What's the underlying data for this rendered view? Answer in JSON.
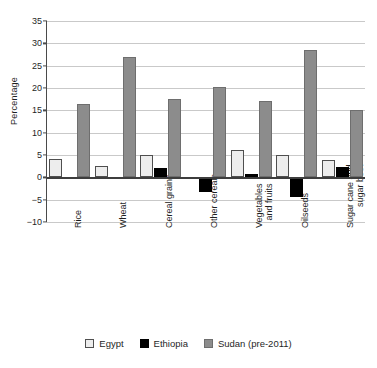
{
  "chart_data": {
    "type": "bar",
    "title": "",
    "xlabel": "",
    "ylabel": "Percentage",
    "ylim": [
      -10,
      35
    ],
    "ytick_labels": [
      "35",
      "30",
      "25",
      "20",
      "15",
      "10",
      "5",
      "0",
      "-5",
      "-10"
    ],
    "yticks": [
      35,
      30,
      25,
      20,
      15,
      10,
      5,
      0,
      -5,
      -10
    ],
    "grid": true,
    "legend_position": "bottom",
    "categories": [
      "Rice",
      "Wheat",
      "Cereal grains",
      "Other cereals",
      "Vegetables and fruits",
      "Oilseeds",
      "Sugar cane and sugar beet"
    ],
    "category_lines": [
      [
        "Rice"
      ],
      [
        "Wheat"
      ],
      [
        "Cereal grains"
      ],
      [
        "Other cereals"
      ],
      [
        "Vegetables",
        "and fruits"
      ],
      [
        "Oilseeds"
      ],
      [
        "Sugar cane and",
        "sugar beet"
      ]
    ],
    "series": [
      {
        "name": "Egypt",
        "color": "#ededed",
        "values": [
          4.2,
          2.6,
          5.0,
          -0.3,
          6.1,
          5.0,
          3.8
        ]
      },
      {
        "name": "Ethiopia",
        "color": "#000000",
        "values": [
          -0.2,
          -0.2,
          2.1,
          -3.2,
          0.8,
          -4.5,
          2.3
        ]
      },
      {
        "name": "Sudan (pre-2011)",
        "color": "#8c8c8c",
        "values": [
          16.5,
          26.9,
          17.5,
          20.3,
          17.1,
          28.5,
          15.1
        ]
      }
    ]
  },
  "legend": {
    "items": [
      {
        "label": "Egypt"
      },
      {
        "label": "Ethiopia"
      },
      {
        "label": "Sudan (pre-2011)"
      }
    ]
  }
}
